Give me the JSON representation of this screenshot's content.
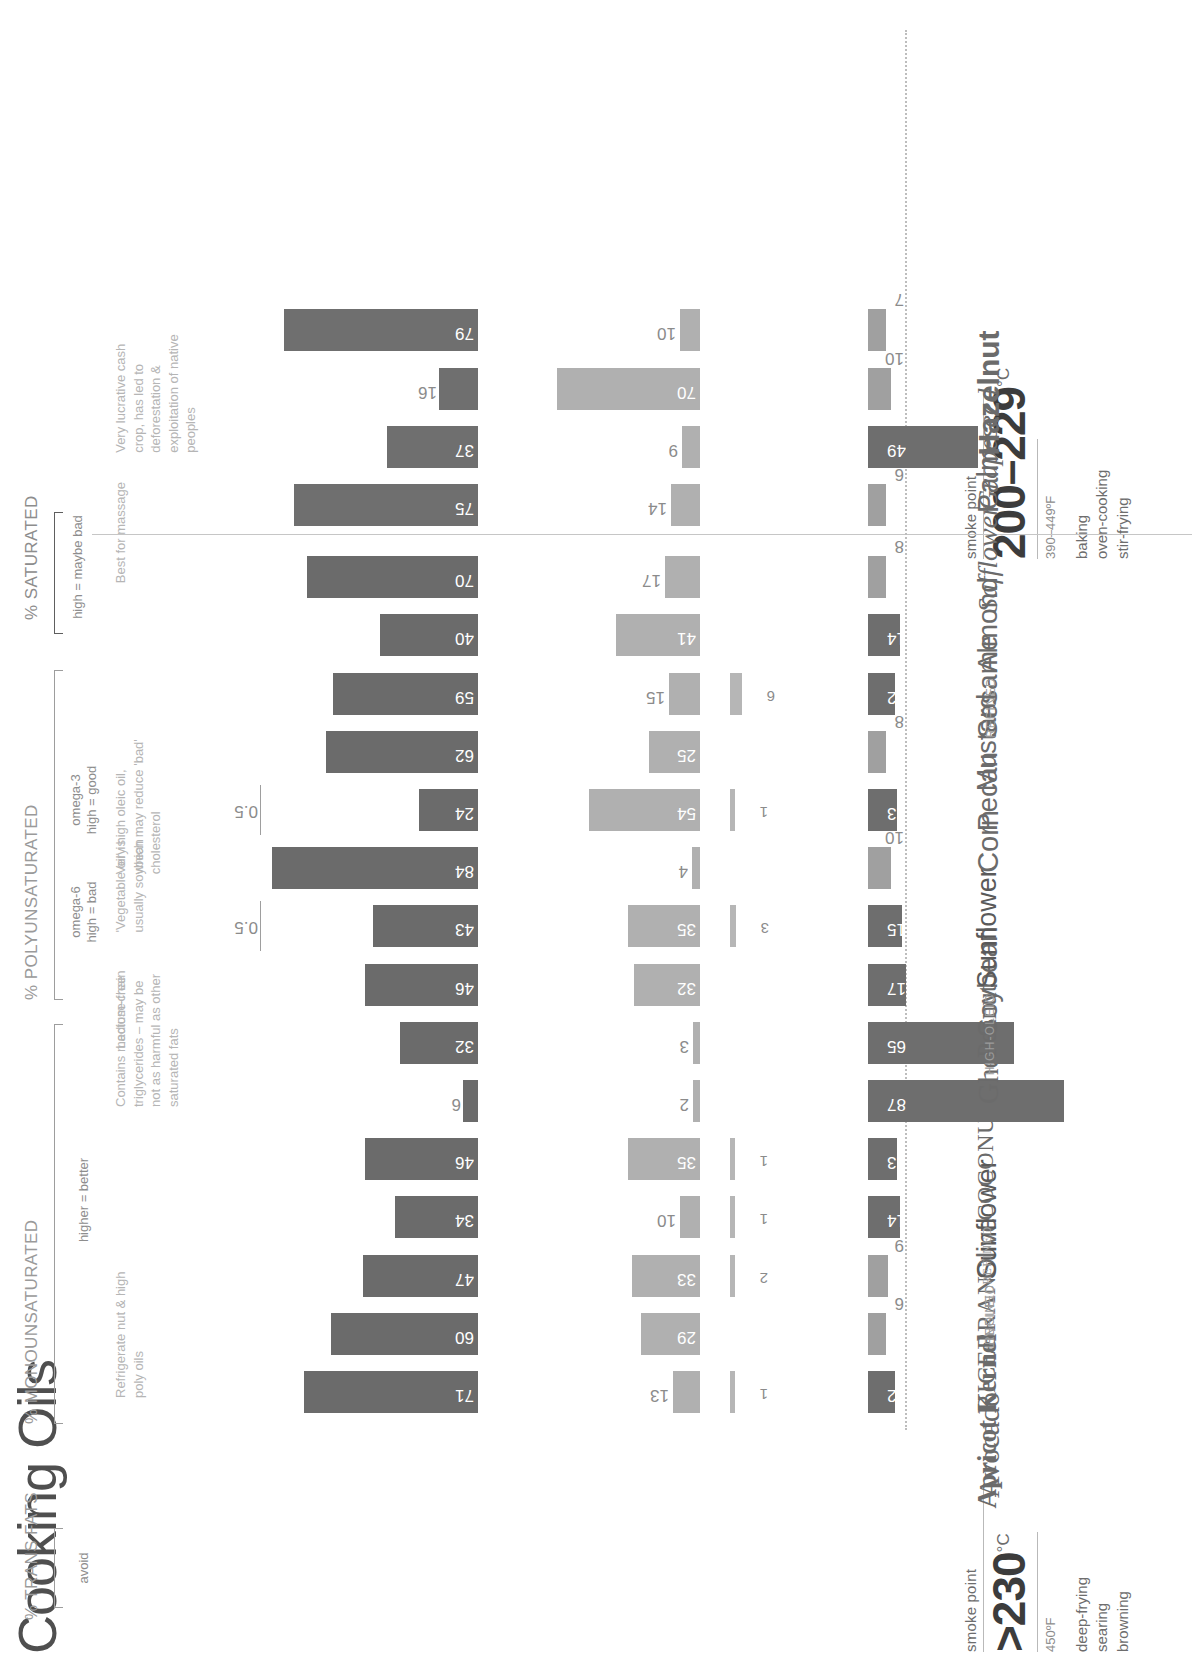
{
  "title": "Cooking Oils",
  "headers": {
    "saturated": "% SATURATED",
    "saturated_sub": "high = maybe bad",
    "poly": "% POLYUNSATURATED",
    "omega3": "omega-3",
    "omega3_sub": "high = good",
    "omega6": "omega-6",
    "omega6_sub": "high = bad",
    "mono": "% MONOUNSATURATED",
    "mono_sub": "higher = better",
    "trans": "% TRANS FATS",
    "trans_sub": "avoid",
    "smoke_point_label": "smoke point"
  },
  "groups": [
    {
      "temp": "&gt;230",
      "temp_plain": ">230",
      "degree": "°C",
      "fahrenheit": "450ºF",
      "uses": [
        "deep-frying",
        "searing",
        "browning"
      ]
    },
    {
      "temp": "200–229",
      "temp_plain": "200-229",
      "degree": "°C",
      "fahrenheit": "390–449ºF",
      "uses": [
        "baking",
        "oven-cooking",
        "stir-frying"
      ]
    }
  ],
  "chart_data": {
    "type": "bar",
    "title": "Cooking Oils",
    "xlabel": "",
    "ylabel": "% of fat composition",
    "series_names": [
      "% SATURATED",
      "omega-3",
      "omega-6",
      "% MONOUNSATURATED",
      "% TRANS FATS"
    ],
    "categories": [
      "Avocado",
      "Apricot Kernel",
      "RICEBRAN",
      "Olive",
      "Sunflower",
      "COCONUT",
      "Ghee",
      "Peanut",
      "Soybean",
      "Sunflower",
      "Corn",
      "Pecan",
      "Mustard",
      "Sesame",
      "Almond",
      "Safflower",
      "Palm",
      "Grapeseed",
      "Hazelnut"
    ],
    "saturated": [
      12,
      6,
      9,
      14,
      13,
      87,
      65,
      17,
      15,
      10,
      13,
      8,
      12,
      14,
      8,
      6,
      49,
      10,
      7
    ],
    "omega3": [
      1,
      null,
      2,
      1,
      1,
      null,
      null,
      null,
      3,
      null,
      1,
      null,
      6,
      null,
      null,
      null,
      null,
      null,
      null
    ],
    "omega6": [
      13,
      29,
      33,
      10,
      35,
      2,
      3,
      32,
      35,
      4,
      54,
      25,
      15,
      41,
      17,
      14,
      9,
      70,
      10
    ],
    "mono": [
      71,
      60,
      47,
      34,
      46,
      6,
      32,
      46,
      43,
      84,
      24,
      62,
      59,
      40,
      70,
      75,
      37,
      16,
      79
    ],
    "trans": [
      null,
      null,
      null,
      null,
      null,
      null,
      null,
      null,
      0.5,
      null,
      0.5,
      null,
      null,
      null,
      null,
      null,
      null,
      null,
      null
    ],
    "grid": false,
    "legend": "top"
  },
  "rows": [
    {
      "prefix": "",
      "name": "Avocado",
      "style": "serif",
      "size": 30,
      "group": 0,
      "saturated": "12",
      "omega3": "1",
      "omega6": "13",
      "mono": "71",
      "trans": "",
      "note": "Refrigerate nut & high\npoly oils"
    },
    {
      "prefix": "",
      "name": "Apricot Kernel",
      "style": "serif-b",
      "size": 27,
      "group": 0,
      "saturated": "6",
      "omega3": "",
      "omega6": "29",
      "mono": "60",
      "trans": "",
      "note": ""
    },
    {
      "prefix": "",
      "name": "RICEBRAN",
      "style": "caps",
      "size": 26,
      "group": 0,
      "saturated": "9",
      "omega3": "2",
      "omega6": "33",
      "mono": "47",
      "trans": "",
      "note": ""
    },
    {
      "prefix": "REFINED",
      "name": "Olive",
      "style": "sans",
      "size": 27,
      "group": 0,
      "saturated": "14",
      "omega3": "1",
      "omega6": "10",
      "mono": "34",
      "trans": "",
      "note": ""
    },
    {
      "prefix": "LINOLEIC",
      "name": "Sunflower",
      "style": "deco",
      "size": 27,
      "group": 0,
      "saturated": "13",
      "omega3": "1",
      "omega6": "35",
      "mono": "46",
      "trans": "",
      "note": ""
    },
    {
      "prefix": "REFINED",
      "name": "COCONUT",
      "style": "caps",
      "size": 24,
      "group": 0,
      "saturated": "87",
      "omega3": "",
      "omega6": "2",
      "mono": "6",
      "trans": "",
      "note": "Contains medium-chain\ntriglycerides – may be\nnot as harmful as other\nsaturated fats"
    },
    {
      "prefix": "",
      "name": "Ghee",
      "style": "serif",
      "size": 29,
      "group": 0,
      "saturated": "65",
      "omega3": "",
      "omega6": "3",
      "mono": "32",
      "trans": "",
      "note": "Lactose-free"
    },
    {
      "prefix": "",
      "name": "Peanut",
      "style": "serif",
      "size": 27,
      "group": 0,
      "saturated": "17",
      "omega3": "",
      "omega6": "32",
      "mono": "46",
      "trans": "",
      "note": ""
    },
    {
      "prefix": "",
      "name": "Soybean",
      "style": "sans",
      "size": 28,
      "group": 0,
      "saturated": "15",
      "omega3": "3",
      "omega6": "35",
      "mono": "43",
      "trans": "0.5",
      "note": "'Vegetable oil' is\nusually soybean"
    },
    {
      "prefix": "HIGH-OLEIC",
      "name": "Sunflower",
      "style": "deco",
      "size": 27,
      "group": 0,
      "saturated": "10",
      "omega3": "",
      "omega6": "4",
      "mono": "84",
      "trans": "",
      "note": "Very high oleic oil,\nwhich may reduce 'bad'\ncholesterol"
    },
    {
      "prefix": "",
      "name": "Corn",
      "style": "sans",
      "size": 29,
      "group": 0,
      "saturated": "13",
      "omega3": "1",
      "omega6": "54",
      "mono": "24",
      "trans": "0.5",
      "note": ""
    },
    {
      "prefix": "",
      "name": "Pecan",
      "style": "sans",
      "size": 28,
      "group": 0,
      "saturated": "8",
      "omega3": "",
      "omega6": "25",
      "mono": "62",
      "trans": "",
      "note": ""
    },
    {
      "prefix": "",
      "name": "Mustard",
      "style": "sans",
      "size": 27,
      "group": 0,
      "saturated": "12",
      "omega3": "6",
      "omega6": "15",
      "mono": "59",
      "trans": "",
      "note": ""
    },
    {
      "prefix": "",
      "name": "Sesame",
      "style": "sans",
      "size": 28,
      "group": 0,
      "saturated": "14",
      "omega3": "",
      "omega6": "41",
      "mono": "40",
      "trans": "",
      "note": ""
    },
    {
      "prefix": "REFINED",
      "name": "Almond",
      "style": "sans",
      "size": 28,
      "group": 0,
      "saturated": "8",
      "omega3": "",
      "omega6": "17",
      "mono": "70",
      "trans": "",
      "note": "Best for massage"
    },
    {
      "prefix": "",
      "name": "Safflower",
      "style": "italic",
      "size": 28,
      "group": 1,
      "saturated": "6",
      "omega3": "",
      "omega6": "14",
      "mono": "75",
      "trans": "",
      "note": ""
    },
    {
      "prefix": "",
      "name": "Palm",
      "style": "sans",
      "size": 29,
      "group": 1,
      "saturated": "49",
      "omega3": "",
      "omega6": "9",
      "mono": "37",
      "trans": "",
      "note": "Very lucrative cash\ncrop, has led to\ndeforestation &\nexploitation of native\npeoples"
    },
    {
      "prefix": "",
      "name": "Grapeseed",
      "style": "italic",
      "size": 28,
      "group": 1,
      "saturated": "10",
      "omega3": "",
      "omega6": "70",
      "mono": "16",
      "trans": "",
      "note": ""
    },
    {
      "prefix": "",
      "name": "Hazelnut",
      "style": "sans-b",
      "size": 30,
      "group": 1,
      "saturated": "7",
      "omega3": "",
      "omega6": "10",
      "mono": "79",
      "trans": "",
      "note": ""
    }
  ],
  "colors": {
    "saturated_bar": "#6e6e6e",
    "poly_bar": "#b2b2b2",
    "mono_bar": "#6b6b6b",
    "text": "#4a4a4a",
    "muted": "#9a9a9a",
    "note": "#b5b5b5"
  }
}
